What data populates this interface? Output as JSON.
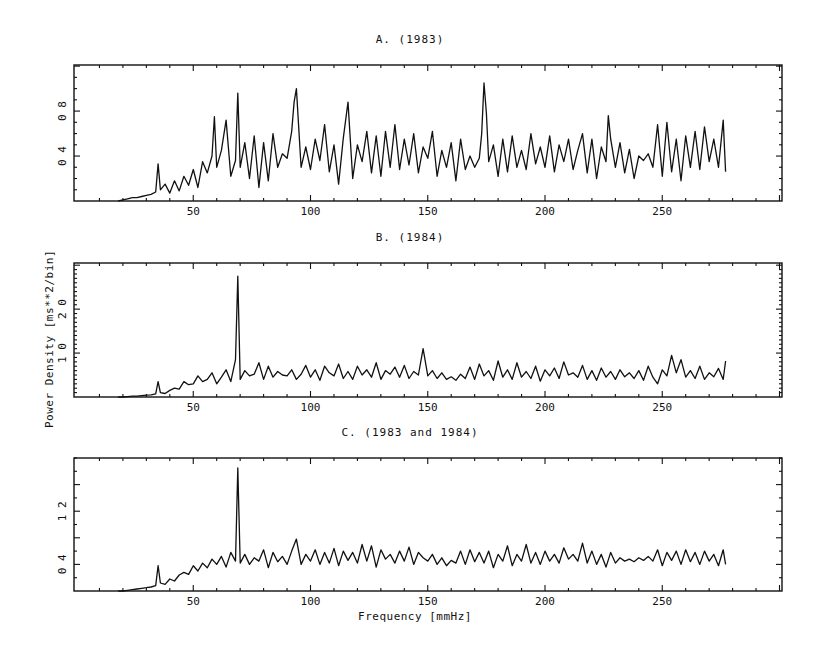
{
  "figure": {
    "xlabel": "Frequency [mmHz]",
    "ylabel": "Power Density [ms**2/bin]"
  },
  "chart_data": [
    {
      "type": "line",
      "title": "A. (1983)",
      "xlabel": "Frequency [mmHz]",
      "ylabel": "Power Density [ms**2/bin]",
      "xlim": [
        0,
        301
      ],
      "ylim": [
        0,
        1.21
      ],
      "xticks": [
        50,
        100,
        150,
        200,
        250
      ],
      "yticks": [
        0.4,
        0.8
      ],
      "ytick_labels": [
        "0 4",
        "0 8"
      ],
      "grid": false,
      "x": [
        18,
        20,
        22,
        24,
        26,
        28,
        30,
        32,
        34,
        35,
        36,
        38,
        40,
        42,
        44,
        46,
        48,
        50,
        52,
        54,
        56,
        58,
        59,
        60,
        62,
        64,
        66,
        68,
        69,
        70,
        72,
        74,
        76,
        78,
        80,
        82,
        84,
        86,
        88,
        90,
        92,
        93,
        94,
        96,
        98,
        100,
        102,
        104,
        106,
        108,
        110,
        112,
        114,
        116,
        118,
        120,
        122,
        124,
        126,
        128,
        130,
        132,
        134,
        136,
        138,
        140,
        142,
        144,
        146,
        148,
        150,
        152,
        154,
        156,
        158,
        160,
        162,
        164,
        166,
        168,
        170,
        172,
        173,
        174,
        175,
        176,
        178,
        180,
        182,
        184,
        186,
        188,
        190,
        192,
        194,
        196,
        198,
        200,
        202,
        204,
        206,
        208,
        210,
        212,
        214,
        216,
        218,
        220,
        222,
        224,
        226,
        227,
        228,
        230,
        232,
        234,
        236,
        238,
        240,
        242,
        244,
        246,
        248,
        250,
        252,
        254,
        256,
        258,
        260,
        262,
        264,
        266,
        268,
        270,
        272,
        274,
        276,
        277
      ],
      "values": [
        0.0,
        0.01,
        0.02,
        0.03,
        0.03,
        0.04,
        0.05,
        0.06,
        0.08,
        0.33,
        0.1,
        0.15,
        0.07,
        0.18,
        0.09,
        0.22,
        0.14,
        0.28,
        0.12,
        0.35,
        0.25,
        0.4,
        0.75,
        0.3,
        0.45,
        0.72,
        0.22,
        0.36,
        0.96,
        0.3,
        0.52,
        0.2,
        0.58,
        0.12,
        0.52,
        0.18,
        0.6,
        0.3,
        0.42,
        0.38,
        0.62,
        0.88,
        1.0,
        0.3,
        0.48,
        0.28,
        0.55,
        0.36,
        0.68,
        0.26,
        0.5,
        0.15,
        0.56,
        0.88,
        0.2,
        0.5,
        0.35,
        0.62,
        0.25,
        0.58,
        0.22,
        0.62,
        0.3,
        0.68,
        0.28,
        0.55,
        0.32,
        0.6,
        0.25,
        0.48,
        0.38,
        0.62,
        0.22,
        0.45,
        0.3,
        0.52,
        0.18,
        0.55,
        0.28,
        0.4,
        0.3,
        0.38,
        0.6,
        1.05,
        0.78,
        0.35,
        0.5,
        0.22,
        0.55,
        0.26,
        0.58,
        0.3,
        0.45,
        0.28,
        0.6,
        0.33,
        0.48,
        0.3,
        0.58,
        0.26,
        0.5,
        0.35,
        0.55,
        0.28,
        0.45,
        0.6,
        0.25,
        0.55,
        0.2,
        0.48,
        0.35,
        0.76,
        0.55,
        0.3,
        0.52,
        0.25,
        0.46,
        0.2,
        0.4,
        0.36,
        0.42,
        0.3,
        0.68,
        0.22,
        0.7,
        0.26,
        0.55,
        0.18,
        0.58,
        0.3,
        0.62,
        0.28,
        0.66,
        0.35,
        0.55,
        0.3,
        0.72,
        0.26
      ]
    },
    {
      "type": "line",
      "title": "B. (1984)",
      "xlabel": "Frequency [mmHz]",
      "ylabel": "Power Density [ms**2/bin]",
      "xlim": [
        0,
        301
      ],
      "ylim": [
        0,
        3.05
      ],
      "xticks": [
        50,
        100,
        150,
        200,
        250
      ],
      "yticks": [
        1.0,
        2.0
      ],
      "ytick_labels": [
        "1 0",
        "2 0"
      ],
      "grid": false,
      "x": [
        18,
        20,
        22,
        24,
        26,
        28,
        30,
        32,
        34,
        35,
        36,
        38,
        40,
        42,
        44,
        46,
        48,
        50,
        52,
        54,
        56,
        58,
        60,
        62,
        64,
        66,
        68,
        69,
        70,
        72,
        74,
        76,
        78,
        80,
        82,
        84,
        86,
        88,
        90,
        92,
        94,
        96,
        98,
        100,
        102,
        104,
        106,
        108,
        110,
        112,
        114,
        116,
        118,
        120,
        122,
        124,
        126,
        128,
        130,
        132,
        134,
        136,
        138,
        140,
        142,
        144,
        146,
        148,
        150,
        152,
        154,
        156,
        158,
        160,
        162,
        164,
        166,
        168,
        170,
        172,
        174,
        176,
        178,
        180,
        182,
        184,
        186,
        188,
        190,
        192,
        194,
        196,
        198,
        200,
        202,
        204,
        206,
        208,
        210,
        212,
        214,
        216,
        218,
        220,
        222,
        224,
        226,
        228,
        230,
        232,
        234,
        236,
        238,
        240,
        242,
        244,
        246,
        248,
        250,
        252,
        254,
        256,
        258,
        260,
        262,
        264,
        266,
        268,
        270,
        272,
        274,
        276,
        277
      ],
      "values": [
        0.0,
        0.0,
        0.01,
        0.02,
        0.02,
        0.03,
        0.04,
        0.05,
        0.07,
        0.35,
        0.1,
        0.08,
        0.15,
        0.2,
        0.18,
        0.35,
        0.28,
        0.3,
        0.48,
        0.35,
        0.4,
        0.55,
        0.3,
        0.45,
        0.62,
        0.35,
        0.85,
        2.75,
        0.4,
        0.6,
        0.48,
        0.52,
        0.78,
        0.4,
        0.7,
        0.45,
        0.58,
        0.5,
        0.48,
        0.62,
        0.4,
        0.52,
        0.72,
        0.45,
        0.62,
        0.38,
        0.7,
        0.55,
        0.48,
        0.75,
        0.42,
        0.58,
        0.4,
        0.7,
        0.5,
        0.62,
        0.45,
        0.78,
        0.4,
        0.6,
        0.52,
        0.68,
        0.45,
        0.72,
        0.42,
        0.58,
        0.5,
        1.1,
        0.48,
        0.6,
        0.42,
        0.55,
        0.4,
        0.46,
        0.38,
        0.52,
        0.42,
        0.68,
        0.4,
        0.75,
        0.48,
        0.6,
        0.38,
        0.82,
        0.45,
        0.62,
        0.4,
        0.78,
        0.45,
        0.58,
        0.42,
        0.7,
        0.36,
        0.62,
        0.48,
        0.66,
        0.42,
        0.8,
        0.5,
        0.55,
        0.45,
        0.72,
        0.4,
        0.6,
        0.38,
        0.66,
        0.45,
        0.58,
        0.4,
        0.62,
        0.46,
        0.55,
        0.42,
        0.6,
        0.38,
        0.7,
        0.45,
        0.3,
        0.62,
        0.48,
        0.95,
        0.55,
        0.85,
        0.45,
        0.6,
        0.42,
        0.7,
        0.4,
        0.55,
        0.46,
        0.65,
        0.4,
        0.82
      ]
    },
    {
      "type": "line",
      "title": "C. (1983 and 1984)",
      "xlabel": "Frequency [mmHz]",
      "ylabel": "Power Density [ms**2/bin]",
      "xlim": [
        0,
        301
      ],
      "ylim": [
        0,
        2.0
      ],
      "xticks": [
        50,
        100,
        150,
        200,
        250
      ],
      "yticks": [
        0.4,
        1.2
      ],
      "ytick_labels": [
        "0 4",
        "1 2"
      ],
      "grid": false,
      "x": [
        18,
        20,
        22,
        24,
        26,
        28,
        30,
        32,
        34,
        35,
        36,
        38,
        40,
        42,
        44,
        46,
        48,
        50,
        52,
        54,
        56,
        58,
        60,
        62,
        64,
        66,
        68,
        69,
        70,
        72,
        74,
        76,
        78,
        80,
        82,
        84,
        86,
        88,
        90,
        92,
        94,
        96,
        98,
        100,
        102,
        104,
        106,
        108,
        110,
        112,
        114,
        116,
        118,
        120,
        122,
        124,
        126,
        128,
        130,
        132,
        134,
        136,
        138,
        140,
        142,
        144,
        146,
        148,
        150,
        152,
        154,
        156,
        158,
        160,
        162,
        164,
        166,
        168,
        170,
        172,
        174,
        176,
        178,
        180,
        182,
        184,
        186,
        188,
        190,
        192,
        194,
        196,
        198,
        200,
        202,
        204,
        206,
        208,
        210,
        212,
        214,
        216,
        218,
        220,
        222,
        224,
        226,
        228,
        230,
        232,
        234,
        236,
        238,
        240,
        242,
        244,
        246,
        248,
        250,
        252,
        254,
        256,
        258,
        260,
        262,
        264,
        266,
        268,
        270,
        272,
        274,
        276,
        277
      ],
      "values": [
        0.0,
        0.0,
        0.01,
        0.02,
        0.03,
        0.04,
        0.05,
        0.06,
        0.08,
        0.38,
        0.12,
        0.1,
        0.18,
        0.15,
        0.24,
        0.28,
        0.25,
        0.38,
        0.3,
        0.42,
        0.35,
        0.48,
        0.4,
        0.52,
        0.36,
        0.58,
        0.45,
        1.85,
        0.42,
        0.55,
        0.4,
        0.5,
        0.45,
        0.62,
        0.35,
        0.58,
        0.44,
        0.52,
        0.4,
        0.6,
        0.78,
        0.4,
        0.55,
        0.45,
        0.62,
        0.4,
        0.58,
        0.42,
        0.64,
        0.38,
        0.6,
        0.46,
        0.58,
        0.42,
        0.7,
        0.45,
        0.68,
        0.36,
        0.62,
        0.48,
        0.55,
        0.42,
        0.6,
        0.45,
        0.66,
        0.4,
        0.58,
        0.5,
        0.45,
        0.55,
        0.4,
        0.5,
        0.38,
        0.46,
        0.42,
        0.6,
        0.4,
        0.62,
        0.44,
        0.58,
        0.42,
        0.6,
        0.35,
        0.55,
        0.45,
        0.68,
        0.38,
        0.55,
        0.45,
        0.7,
        0.42,
        0.58,
        0.4,
        0.6,
        0.45,
        0.55,
        0.42,
        0.65,
        0.48,
        0.55,
        0.45,
        0.72,
        0.42,
        0.6,
        0.4,
        0.55,
        0.36,
        0.58,
        0.42,
        0.5,
        0.45,
        0.48,
        0.44,
        0.5,
        0.46,
        0.52,
        0.45,
        0.62,
        0.38,
        0.58,
        0.46,
        0.6,
        0.4,
        0.62,
        0.44,
        0.58,
        0.4,
        0.6,
        0.45,
        0.55,
        0.38,
        0.62,
        0.4
      ]
    }
  ],
  "layout": {
    "panels": [
      {
        "frame": [
          74,
          65,
          782,
          201
        ],
        "title_pos": [
          410,
          40
        ]
      },
      {
        "frame": [
          74,
          263,
          782,
          397
        ],
        "title_pos": [
          410,
          238
        ]
      },
      {
        "frame": [
          74,
          458,
          782,
          591
        ],
        "title_pos": [
          410,
          433
        ]
      }
    ],
    "x_origin_px": 76,
    "x_px_per_unit": 2.345
  }
}
